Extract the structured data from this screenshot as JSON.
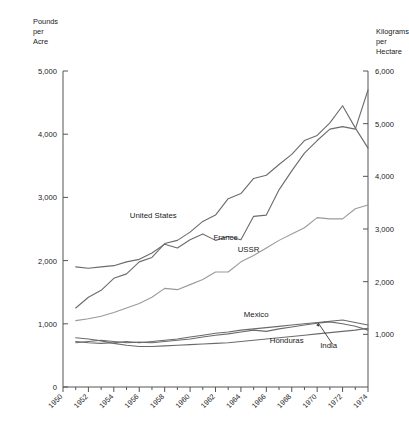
{
  "chart_data": {
    "type": "line",
    "title": "",
    "subtitle": "",
    "xlabel": "",
    "ylabel": "Pounds per Acre",
    "ylabel_right": "Kilograms per Hectare",
    "grid": false,
    "legend_position": "inline-labels",
    "x": [
      1951,
      1952,
      1953,
      1954,
      1955,
      1956,
      1957,
      1958,
      1959,
      1960,
      1961,
      1962,
      1963,
      1964,
      1965,
      1966,
      1967,
      1968,
      1969,
      1970,
      1971,
      1972,
      1973,
      1974
    ],
    "xlim": [
      1950,
      1974
    ],
    "ylim": [
      0,
      5000
    ],
    "ylim_right": [
      0,
      6000
    ],
    "xticks": [
      "1950",
      "1952",
      "1954",
      "1956",
      "1958",
      "1960",
      "1962",
      "1964",
      "1966",
      "1968",
      "1970",
      "1972",
      "1974"
    ],
    "xtick_values": [
      1950,
      1952,
      1954,
      1956,
      1958,
      1960,
      1962,
      1964,
      1966,
      1968,
      1970,
      1972,
      1974
    ],
    "yticks_left": [
      "0",
      "1,000",
      "2,000",
      "3,000",
      "4,000",
      "5,000"
    ],
    "ytick_values_left": [
      0,
      1000,
      2000,
      3000,
      4000,
      5000
    ],
    "yticks_right": [
      "1,000",
      "2,000",
      "3,000",
      "4,000",
      "5,000",
      "6,000"
    ],
    "ytick_values_right": [
      1000,
      2000,
      3000,
      4000,
      5000,
      6000
    ],
    "series": [
      {
        "name": "United States",
        "color": "#6b6b6b",
        "label_x": 1957.1,
        "label_y": 2680,
        "values": [
          1250,
          1420,
          1530,
          1720,
          1790,
          1980,
          2050,
          2270,
          2320,
          2450,
          2620,
          2720,
          2980,
          3060,
          3300,
          3350,
          3520,
          3680,
          3900,
          3980,
          4180,
          4450,
          4100,
          3780
        ]
      },
      {
        "name": "France",
        "color": "#6b6b6b",
        "label_x": 1962.8,
        "label_y": 2320,
        "values": [
          1900,
          1880,
          1900,
          1920,
          1980,
          2020,
          2120,
          2260,
          2200,
          2330,
          2420,
          2320,
          2380,
          2330,
          2700,
          2720,
          3120,
          3420,
          3700,
          3900,
          4080,
          4120,
          4080,
          4700
        ]
      },
      {
        "name": "USSR",
        "color": "#9a9a9a",
        "label_x": 1964.6,
        "label_y": 2140,
        "values": [
          1050,
          1080,
          1120,
          1180,
          1250,
          1320,
          1420,
          1560,
          1540,
          1620,
          1700,
          1820,
          1820,
          1980,
          2080,
          2200,
          2320,
          2420,
          2520,
          2680,
          2660,
          2660,
          2820,
          2880
        ]
      },
      {
        "name": "Mexico",
        "color": "#6b6b6b",
        "label_x": 1965.2,
        "label_y": 1100,
        "values": [
          720,
          700,
          690,
          700,
          720,
          700,
          720,
          740,
          760,
          790,
          820,
          850,
          870,
          900,
          920,
          940,
          960,
          980,
          1000,
          1020,
          1040,
          1060,
          1020,
          980
        ]
      },
      {
        "name": "Honduras",
        "color": "#6b6b6b",
        "label_x": 1967.6,
        "label_y": 700,
        "values": [
          780,
          760,
          730,
          690,
          660,
          640,
          640,
          650,
          660,
          670,
          680,
          690,
          700,
          720,
          740,
          760,
          780,
          800,
          820,
          840,
          860,
          880,
          900,
          930
        ]
      },
      {
        "name": "India",
        "color": "#6b6b6b",
        "label_x": 1970.9,
        "label_y": 620,
        "values": [
          700,
          720,
          740,
          720,
          700,
          710,
          700,
          720,
          740,
          760,
          790,
          820,
          840,
          870,
          900,
          880,
          920,
          950,
          980,
          1010,
          1030,
          1000,
          960,
          900
        ]
      }
    ],
    "annotations": [
      {
        "name": "india-leader",
        "target_x": 1970.1,
        "target_y": 1010,
        "from_x": 1971.2,
        "from_y": 680
      }
    ]
  }
}
